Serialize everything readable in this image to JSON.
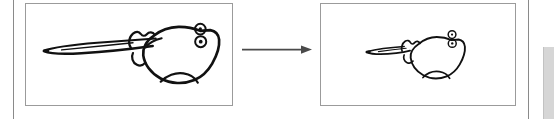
{
  "figure": {
    "kind": "sketch-transformation-figure",
    "background_color": "#ffffff",
    "ink_color": "#111111",
    "panel_border_color": "#9b9b9b",
    "margin_rule_color": "#8a8a8a",
    "scrollbar_color": "#d6d6d6",
    "panels": [
      {
        "id": "input-sketch-panel",
        "role": "input",
        "caption": "",
        "subject": "hand-drawn stingray",
        "subject_detail": "rough pencil sketch of a ray viewed from the side with a long tapering tail extending to the left, a broad rounded disc-shaped body, a pectoral fin lobe at upper-left of the body, a small pelvic fin at the lower body, and two small circles with centre dots representing the eye and spiracle near the upper-right of the head",
        "stroke_style": "rough multi-pass pencil outline",
        "eye_count": 2
      },
      {
        "id": "output-sketch-panel",
        "role": "output",
        "caption": "",
        "subject": "hand-drawn stingray",
        "subject_detail": "smaller, cleaner redrawing of the same ray: shortened tapering tail to the left, compact rounded body, and the two small dotted circles for eye and spiracle at the upper right",
        "stroke_style": "thin single-pass outline",
        "eye_count": 2
      }
    ],
    "arrow": {
      "id": "transform-arrow",
      "direction": "right",
      "label": "",
      "color": "#4a4a4a",
      "from_panel": "input-sketch-panel",
      "to_panel": "output-sketch-panel"
    },
    "scrollbar": {
      "id": "vertical-scrollbar",
      "orientation": "vertical",
      "position": "right-edge"
    }
  }
}
